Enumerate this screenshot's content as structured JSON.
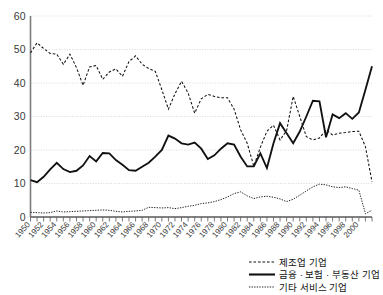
{
  "chart_data": {
    "type": "line",
    "title": "",
    "subtitle": "",
    "xlabel": "",
    "ylabel": "",
    "xlim": [
      1950,
      2002
    ],
    "ylim": [
      0,
      60
    ],
    "yticks": [
      0,
      10,
      20,
      30,
      40,
      50,
      60
    ],
    "grid": true,
    "legend_position": "bottom-right",
    "x": [
      1950,
      1951,
      1952,
      1953,
      1954,
      1955,
      1956,
      1957,
      1958,
      1959,
      1960,
      1961,
      1962,
      1963,
      1964,
      1965,
      1966,
      1967,
      1968,
      1969,
      1970,
      1971,
      1972,
      1973,
      1974,
      1975,
      1976,
      1977,
      1978,
      1979,
      1980,
      1981,
      1982,
      1983,
      1984,
      1985,
      1986,
      1987,
      1988,
      1989,
      1990,
      1991,
      1992,
      1993,
      1994,
      1995,
      1996,
      1997,
      1998,
      1999,
      2000,
      2001,
      2002
    ],
    "xtick_labels": [
      "1950",
      "1952",
      "1954",
      "1956",
      "1958",
      "1960",
      "1962",
      "1964",
      "1966",
      "1968",
      "1970",
      "1972",
      "1974",
      "1976",
      "1978",
      "1980",
      "1982",
      "1984",
      "1986",
      "1988",
      "1990",
      "1992",
      "1994",
      "1996",
      "1998",
      "2000"
    ],
    "xtick_values": [
      1950,
      1952,
      1954,
      1956,
      1958,
      1960,
      1962,
      1964,
      1966,
      1968,
      1970,
      1972,
      1974,
      1976,
      1978,
      1980,
      1982,
      1984,
      1986,
      1988,
      1990,
      1992,
      1994,
      1996,
      1998,
      2000
    ],
    "series": [
      {
        "name": "제조업 기업",
        "style": "dashed",
        "color": "#111111",
        "values": [
          49.0,
          52.0,
          50.3,
          48.8,
          48.6,
          45.6,
          48.6,
          44.6,
          39.3,
          44.8,
          45.2,
          41.1,
          43.3,
          44.2,
          42.0,
          46.4,
          48.1,
          45.6,
          44.3,
          43.5,
          38.0,
          32.2,
          36.8,
          40.5,
          37.0,
          31.0,
          35.3,
          36.6,
          36.0,
          35.6,
          35.6,
          32.2,
          26.0,
          22.0,
          15.2,
          20.8,
          25.6,
          27.4,
          23.0,
          25.8,
          36.0,
          30.0,
          24.0,
          23.0,
          23.6,
          26.0,
          24.5,
          25.0,
          25.2,
          25.5,
          25.6,
          21.0,
          10.5
        ]
      },
      {
        "name": "금융 · 보험 · 부동산 기업",
        "style": "solid",
        "color": "#111111",
        "values": [
          11.0,
          10.4,
          12.0,
          14.2,
          16.2,
          14.3,
          13.4,
          13.8,
          15.4,
          18.2,
          16.6,
          19.1,
          19.0,
          17.0,
          15.6,
          14.0,
          13.8,
          15.0,
          16.2,
          18.0,
          20.0,
          24.3,
          23.4,
          22.0,
          21.6,
          22.2,
          20.4,
          17.3,
          18.4,
          20.4,
          22.0,
          21.6,
          18.0,
          15.1,
          15.1,
          19.0,
          14.6,
          22.0,
          28.0,
          25.0,
          22.0,
          25.5,
          30.0,
          34.7,
          34.5,
          23.8,
          30.6,
          29.5,
          31.0,
          29.3,
          31.2,
          38.0,
          45.0
        ]
      },
      {
        "name": "기타 서비스 기업",
        "style": "dotted",
        "color": "#111111",
        "values": [
          1.4,
          1.3,
          1.2,
          1.3,
          1.8,
          1.5,
          1.6,
          1.7,
          1.8,
          1.9,
          2.0,
          2.1,
          2.0,
          1.7,
          1.5,
          1.7,
          1.8,
          2.0,
          2.9,
          2.8,
          2.7,
          2.8,
          2.5,
          2.8,
          3.2,
          3.5,
          4.0,
          4.2,
          4.6,
          5.2,
          6.0,
          7.0,
          7.5,
          6.3,
          5.5,
          6.0,
          6.2,
          5.9,
          5.4,
          4.6,
          5.3,
          6.5,
          7.8,
          9.0,
          9.8,
          9.6,
          9.0,
          8.8,
          9.0,
          8.5,
          8.0,
          1.0,
          2.0
        ]
      }
    ],
    "legend": [
      {
        "label": "제조업 기업",
        "style": "dashed"
      },
      {
        "label": "금융 · 보험 · 부동산 기업",
        "style": "solid"
      },
      {
        "label": "기타 서비스 기업",
        "style": "dotted"
      }
    ]
  }
}
